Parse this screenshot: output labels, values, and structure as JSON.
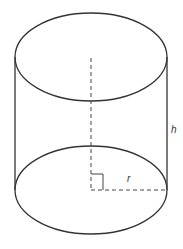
{
  "diagram": {
    "type": "cylinder",
    "labels": {
      "height": "h",
      "radius": "r"
    },
    "colors": {
      "stroke": "#333333",
      "background": "#ffffff"
    }
  }
}
